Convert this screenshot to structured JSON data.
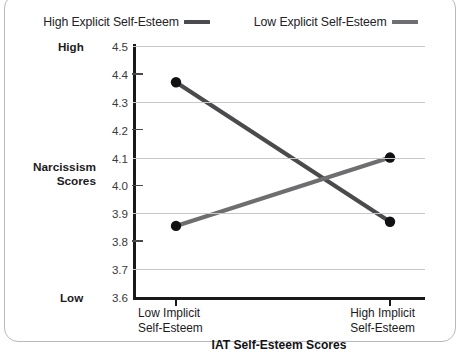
{
  "legend": {
    "position": "top-center",
    "entries": [
      {
        "label": "High Explicit Self-Esteem",
        "color": "#4b4b4d",
        "key": "high"
      },
      {
        "label": "Low Explicit Self-Esteem",
        "color": "#6e6e70",
        "key": "low"
      }
    ]
  },
  "axes": {
    "y_title_line1": "Narcissism",
    "y_title_line2": "Scores",
    "y_high_anchor": "High",
    "y_low_anchor": "Low",
    "x_title": "IAT Self-Esteem Scores",
    "x_tick_low_line1": "Low Implicit",
    "x_tick_low_line2": "Self-Esteem",
    "x_tick_high_line1": "High Implicit",
    "x_tick_high_line2": "Self-Esteem"
  },
  "chart_data": {
    "type": "line",
    "title": "",
    "subtitle": "",
    "xlabel": "IAT Self-Esteem Scores",
    "ylabel": "Narcissism Scores",
    "categories": [
      "Low Implicit Self-Esteem",
      "High Implicit Self-Esteem"
    ],
    "ylim": [
      3.6,
      4.5
    ],
    "ytick_values": [
      3.6,
      3.7,
      3.8,
      3.9,
      4.0,
      4.1,
      4.2,
      4.3,
      4.4,
      4.5
    ],
    "ytick_labels": [
      "3.6",
      "3.7",
      "3.8",
      "3.9",
      "4.0",
      "4.1",
      "4.2",
      "4.3",
      "4.4",
      "4.5"
    ],
    "y_axis_anchors": {
      "high": "High",
      "low": "Low"
    },
    "grid": "horizontal-major",
    "legend_position": "top-center",
    "markers": "filled-circle",
    "series": [
      {
        "name": "High Explicit Self-Esteem",
        "color": "#4b4b4d",
        "values": [
          4.37,
          3.87
        ]
      },
      {
        "name": "Low Explicit Self-Esteem",
        "color": "#6e6e70",
        "values": [
          3.855,
          4.1
        ]
      }
    ],
    "annotations": []
  }
}
